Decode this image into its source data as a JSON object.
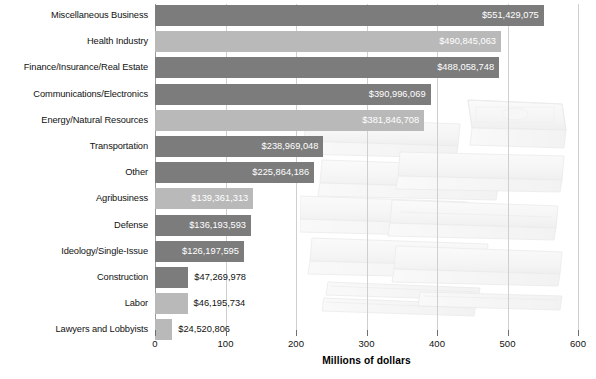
{
  "chart_data": {
    "type": "bar",
    "orientation": "horizontal",
    "title": "",
    "xlabel": "Millions of dollars",
    "ylabel": "",
    "xlim": [
      0,
      600
    ],
    "xticks": [
      0,
      100,
      200,
      300,
      400,
      500,
      600
    ],
    "grid": true,
    "legend": false,
    "units": "dollars",
    "categories": [
      "Miscellaneous Business",
      "Health Industry",
      "Finance/Insurance/Real Estate",
      "Communications/Electronics",
      "Energy/Natural Resources",
      "Transportation",
      "Other",
      "Agribusiness",
      "Defense",
      "Ideology/Single-Issue",
      "Construction",
      "Labor",
      "Lawyers and Lobbyists"
    ],
    "values": [
      551429075,
      490845063,
      488058748,
      390996069,
      381846708,
      238969048,
      225864186,
      139361313,
      136193593,
      126197595,
      47269978,
      46195734,
      24520806
    ],
    "value_labels": [
      "$551,429,075",
      "$490,845,063",
      "$488,058,748",
      "$390,996,069",
      "$381,846,708",
      "$238,969,048",
      "$225,864,186",
      "$139,361,313",
      "$136,193,593",
      "$126,197,595",
      "$47,269,978",
      "$46,195,734",
      "$24,520,806"
    ],
    "bar_shades": [
      "dark",
      "light",
      "dark",
      "dark",
      "light",
      "dark",
      "dark",
      "light",
      "dark",
      "dark",
      "dark",
      "light",
      "light"
    ],
    "label_placement": [
      "inside",
      "inside",
      "inside",
      "inside",
      "inside",
      "inside",
      "inside",
      "inside",
      "inside",
      "inside",
      "outside",
      "outside",
      "outside"
    ],
    "colors": {
      "bar_dark": "#7c7c7c",
      "bar_light": "#b9b9b9",
      "grid": "#cfcfcf",
      "axis": "#9a9a9a",
      "text": "#111111",
      "value_text_inside": "#ffffff"
    },
    "background_graphic": "stacks-of-cash-watermark"
  }
}
